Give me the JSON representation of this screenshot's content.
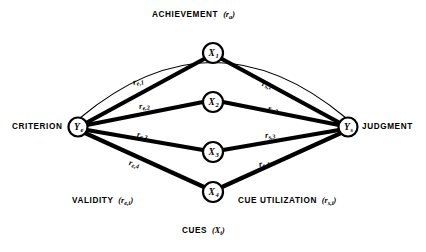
{
  "diagram": {
    "title_top": "ACHIEVEMENT",
    "title_top_symbol": "r",
    "title_top_subscript": "a",
    "bottom_center": "CUES",
    "bottom_center_symbol": "X",
    "bottom_center_subscript": "i",
    "left_side_caption": "VALIDITY",
    "left_side_symbol": "r",
    "left_side_subscript": "e,i",
    "right_side_caption": "CUE UTILIZATION",
    "right_side_symbol": "r",
    "right_side_subscript": "s,i",
    "stroke_color": "#000000",
    "background_color": "#ffffff"
  },
  "nodes": {
    "criterion": {
      "caption": "CRITERION",
      "symbol": "Y",
      "subscript": "e",
      "cx": 78,
      "cy": 127,
      "r": 9.5
    },
    "judgment": {
      "caption": "JUDGMENT",
      "symbol": "Y",
      "subscript": "s",
      "cx": 348,
      "cy": 127,
      "r": 9.5
    },
    "cues": [
      {
        "symbol": "X",
        "subscript": "1",
        "cx": 213,
        "cy": 53,
        "r": 10
      },
      {
        "symbol": "X",
        "subscript": "2",
        "cx": 213,
        "cy": 102,
        "r": 10
      },
      {
        "symbol": "X",
        "subscript": "3",
        "cx": 213,
        "cy": 152,
        "r": 10
      },
      {
        "symbol": "X",
        "subscript": "4",
        "cx": 213,
        "cy": 192,
        "r": 10
      }
    ]
  },
  "edge_labels": {
    "left": [
      {
        "symbol": "r",
        "subscript": "e,1",
        "x": 133,
        "y": 78
      },
      {
        "symbol": "r",
        "subscript": "e,2",
        "x": 139,
        "y": 102
      },
      {
        "symbol": "r",
        "subscript": "e,3",
        "x": 137,
        "y": 130
      },
      {
        "symbol": "r",
        "subscript": "e,4",
        "x": 129,
        "y": 158
      }
    ],
    "right": [
      {
        "symbol": "r",
        "subscript": "s,1",
        "x": 262,
        "y": 79
      },
      {
        "symbol": "r",
        "subscript": "s,2",
        "x": 268,
        "y": 104
      },
      {
        "symbol": "r",
        "subscript": "s,3",
        "x": 265,
        "y": 131
      },
      {
        "symbol": "r",
        "subscript": "s,4",
        "x": 259,
        "y": 160
      }
    ]
  },
  "captions": {
    "achievement_x": 152,
    "achievement_y": 10,
    "criterion_x": 12,
    "criterion_y": 122,
    "judgment_x": 362,
    "judgment_y": 122,
    "validity_x": 72,
    "validity_y": 196,
    "cue_utilization_x": 238,
    "cue_utilization_y": 196,
    "cues_x": 182,
    "cues_y": 226
  }
}
